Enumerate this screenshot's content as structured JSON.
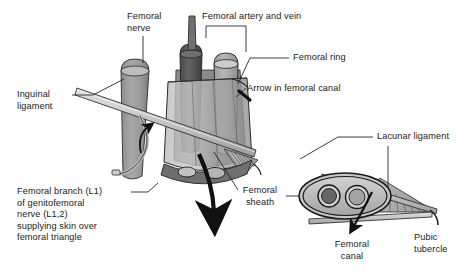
{
  "figure": {
    "type": "anatomical-illustration",
    "canvas": {
      "width": 472,
      "height": 277
    },
    "palette": {
      "background": "#ffffff",
      "outline": "#1a1a1a",
      "artery_dark": "#5d5d5d",
      "vein_mid": "#a9a9a9",
      "nerve_gray": "#9b9b9b",
      "sheath_light": "#c9c9c9",
      "sheath_mid": "#b0b0b0",
      "sheath_dark": "#7c7c7c",
      "ligament_band": "#cfcfcf",
      "hatch_gray": "#8a8a8a",
      "arrow_black": "#111111",
      "label_text": "#1a1a1a"
    }
  },
  "labels": {
    "femoral_nerve": "Femoral\nnerve",
    "femoral_artery_and_vein": "Femoral artery and vein",
    "femoral_ring": "Femoral ring",
    "arrow_in_femoral_canal": "Arrow in femoral canal",
    "inguinal_ligament": "Inguinal\nligament",
    "lacunar_ligament": "Lacunar ligament",
    "femoral_sheath": "Femoral\nsheath",
    "femoral_canal": "Femoral\ncanal",
    "pubic_tubercle": "Pubic\ntubercle",
    "femoral_branch_block": "Femoral branch (L1)\nof genitofemoral\nnerve (L1,2)\nsupplying skin over\nfemoral triangle"
  },
  "structures": {
    "main_view": {
      "name": "femoral sheath cut-away, oblique view",
      "contents": [
        "femoral nerve",
        "femoral artery",
        "femoral vein",
        "femoral canal",
        "inguinal ligament",
        "genitofemoral nerve femoral branch"
      ]
    },
    "inset_view": {
      "name": "femoral sheath cross-section with lacunar ligament",
      "contents": [
        "femoral artery lumen",
        "femoral vein lumen",
        "femoral canal",
        "lacunar ligament",
        "pubic tubercle",
        "inguinal ligament"
      ]
    }
  },
  "icons": {
    "canal_arrow": "downward-arrow",
    "ring_arrow": "short-arrow",
    "curl_arrow": "curved-up-arrow",
    "inset_canal_arrow": "downward-arrow"
  }
}
